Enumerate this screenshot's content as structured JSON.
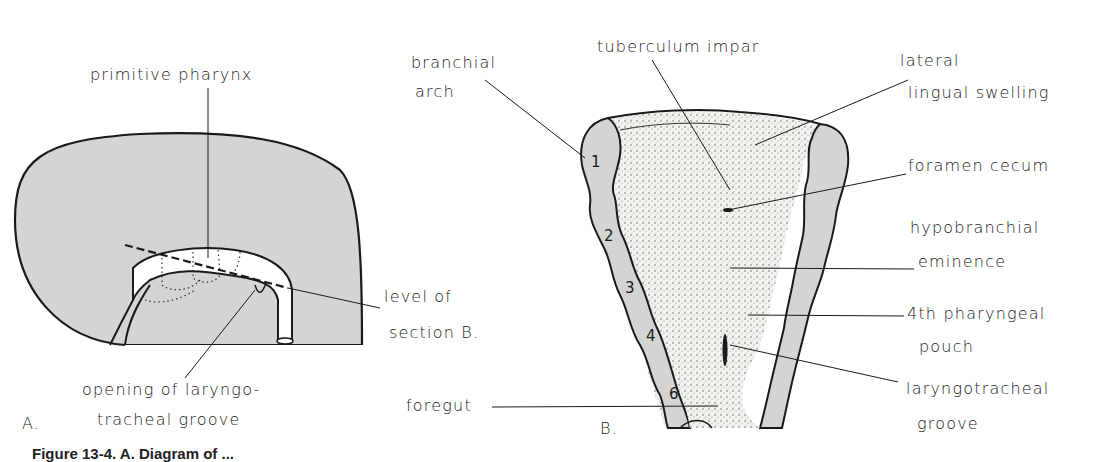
{
  "figure": {
    "caption_partial": "Figure 13-4. A. Diagram of ...",
    "colors": {
      "tissue_gray": "#d4d4d4",
      "stipple_light": "#ece8e4",
      "outline": "#1a1a1a",
      "background": "#ffffff"
    },
    "panel_a": {
      "panel_label": "A.",
      "labels": {
        "primitive_pharynx": "primitive pharynx",
        "level_of_section_line1": "level of",
        "level_of_section_line2": "section B.",
        "opening_line1": "opening of laryngo-",
        "opening_line2": "tracheal groove"
      }
    },
    "panel_b": {
      "panel_label": "B.",
      "arch_numbers": [
        "1",
        "2",
        "3",
        "4",
        "6"
      ],
      "labels": {
        "branchial_arch_line1": "branchial",
        "branchial_arch_line2": "arch",
        "tuberculum_impar": "tuberculum impar",
        "lateral_line1": "lateral",
        "lateral_line2": "lingual swelling",
        "foramen_cecum": "foramen cecum",
        "hypobranchial_line1": "hypobranchial",
        "hypobranchial_line2": "eminence",
        "pouch_line1": "4th pharyngeal",
        "pouch_line2": "pouch",
        "laryngotracheal_line1": "laryngotracheal",
        "laryngotracheal_line2": "groove",
        "foregut": "foregut"
      }
    }
  }
}
